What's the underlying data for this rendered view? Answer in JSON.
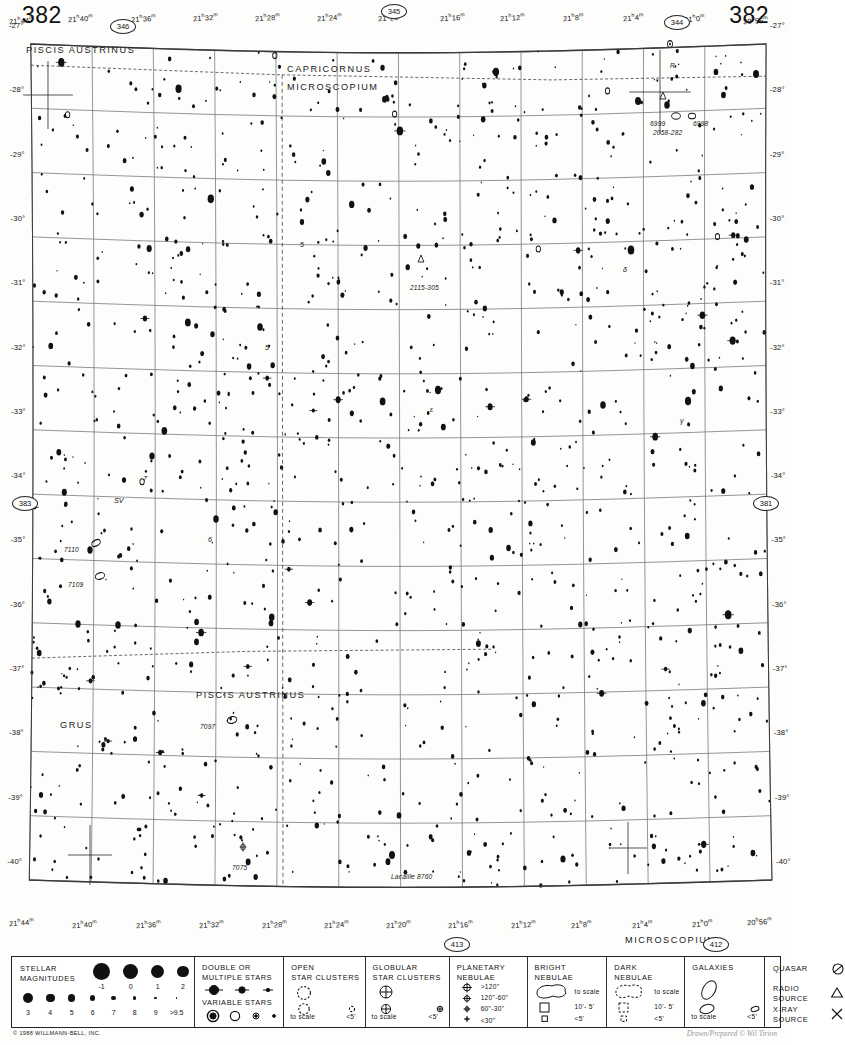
{
  "chart": {
    "number_left": "382",
    "number_right": "382",
    "copyright": "© 1988 WILLMANN-BELL, INC.",
    "signature": "Drawn/Prepared © Wil Tirion",
    "epoch_note": ""
  },
  "neighbors": [
    {
      "id": "346",
      "x": 110,
      "y": 19,
      "name": "neighbor-chart-346"
    },
    {
      "id": "345",
      "x": 381,
      "y": 4,
      "name": "neighbor-chart-345"
    },
    {
      "id": "344",
      "x": 664,
      "y": 15,
      "name": "neighbor-chart-344"
    },
    {
      "id": "383",
      "x": 12,
      "y": 496,
      "name": "neighbor-chart-383"
    },
    {
      "id": "381",
      "x": 753,
      "y": 496,
      "name": "neighbor-chart-381"
    },
    {
      "id": "413",
      "x": 444,
      "y": 937,
      "name": "neighbor-chart-413"
    },
    {
      "id": "412",
      "x": 703,
      "y": 937,
      "name": "neighbor-chart-412"
    }
  ],
  "ra_labels_top": [
    {
      "t": "21h44m",
      "x": 30,
      "y": 12
    },
    {
      "t": "21h40m",
      "x": 110,
      "y": 10
    },
    {
      "t": "21h36m",
      "x": 196,
      "y": 10
    },
    {
      "t": "21h32m",
      "x": 281,
      "y": 9
    },
    {
      "t": "21h28m",
      "x": 366,
      "y": 9
    },
    {
      "t": "21h24m",
      "x": 450,
      "y": 9
    },
    {
      "t": "21h20m",
      "x": 534,
      "y": 9
    },
    {
      "t": "21h16m",
      "x": 618,
      "y": 9
    },
    {
      "t": "21h12m",
      "x": 700,
      "y": 9
    },
    {
      "t": "21h8m",
      "x": 786,
      "y": 9
    },
    {
      "t": "21h4m",
      "x": 869,
      "y": 9
    },
    {
      "t": "21h0m",
      "x": 952,
      "y": 10
    },
    {
      "t": "20h56m",
      "x": 1032,
      "y": 12
    }
  ],
  "ra_labels_bottom": [
    {
      "t": "21h44m",
      "x": 30,
      "y": 900
    },
    {
      "t": "21h40m",
      "x": 116,
      "y": 902
    },
    {
      "t": "21h36m",
      "x": 204,
      "y": 902
    },
    {
      "t": "21h32m",
      "x": 290,
      "y": 902
    },
    {
      "t": "21h28m",
      "x": 375,
      "y": 902
    },
    {
      "t": "21h24m",
      "x": 460,
      "y": 902
    },
    {
      "t": "21h20m",
      "x": 545,
      "y": 902
    },
    {
      "t": "21h16m",
      "x": 630,
      "y": 902
    },
    {
      "t": "21h12m",
      "x": 715,
      "y": 902
    },
    {
      "t": "21h8m",
      "x": 798,
      "y": 902
    },
    {
      "t": "21h4m",
      "x": 880,
      "y": 902
    },
    {
      "t": "21h0m",
      "x": 962,
      "y": 901
    },
    {
      "t": "20h56m",
      "x": 1038,
      "y": 899
    }
  ],
  "dec_labels": [
    "-27°",
    "-28°",
    "-29°",
    "-30°",
    "-31°",
    "-32°",
    "-33°",
    "-34°",
    "-35°",
    "-36°",
    "-37°",
    "-38°",
    "-39°",
    "-40°"
  ],
  "constellations": [
    {
      "name": "PISCIS AUSTRINUS",
      "x": 26,
      "y": 28,
      "id": "piscis-austrinus-top"
    },
    {
      "name": "CAPRICORNUS",
      "x": 287,
      "y": 47,
      "id": "capricornus"
    },
    {
      "name": "MICROSCOPIUM",
      "x": 287,
      "y": 65,
      "id": "microscopium-top"
    },
    {
      "name": "PISCIS AUSTRINUS",
      "x": 196,
      "y": 673,
      "id": "piscis-austrinus-lower"
    },
    {
      "name": "GRUS",
      "x": 60,
      "y": 703,
      "id": "grus"
    },
    {
      "name": "MICROSCOPIUM",
      "x": 625,
      "y": 918,
      "id": "microscopium-bottom"
    }
  ],
  "deep_sky_labels": [
    {
      "t": "6999",
      "x": 650,
      "y": 103,
      "id": "ngc-6999"
    },
    {
      "t": "6998",
      "x": 693,
      "y": 103,
      "id": "ngc-6998"
    },
    {
      "t": "2058-282",
      "x": 653,
      "y": 112,
      "id": "radio-2058-282"
    },
    {
      "t": "2115-305",
      "x": 410,
      "y": 267,
      "id": "radio-2115-305"
    },
    {
      "t": "7110",
      "x": 64,
      "y": 529,
      "id": "ngc-7110"
    },
    {
      "t": "7109",
      "x": 68,
      "y": 564,
      "id": "ngc-7109"
    },
    {
      "t": "7097",
      "x": 200,
      "y": 706,
      "id": "ngc-7097"
    },
    {
      "t": "7075",
      "x": 232,
      "y": 847,
      "id": "ngc-7075"
    },
    {
      "t": "Lacaille 8760",
      "x": 391,
      "y": 856,
      "id": "lacaille-8760"
    },
    {
      "t": "R",
      "x": 670,
      "y": 45,
      "id": "variable-R"
    }
  ],
  "star_labels": [
    {
      "t": "5",
      "x": 300,
      "y": 223,
      "id": "star-5"
    },
    {
      "t": "5",
      "x": 265,
      "y": 326,
      "id": "star-5b"
    },
    {
      "t": "7",
      "x": 143,
      "y": 457,
      "id": "star-7"
    },
    {
      "t": "SV",
      "x": 114,
      "y": 479,
      "id": "star-SV"
    },
    {
      "t": "6",
      "x": 208,
      "y": 518,
      "id": "star-6"
    },
    {
      "t": "δ",
      "x": 623,
      "y": 248,
      "id": "star-delta"
    },
    {
      "t": "ε",
      "x": 430,
      "y": 388,
      "id": "star-epsilon"
    },
    {
      "t": "γ",
      "x": 680,
      "y": 399,
      "id": "star-gamma"
    }
  ],
  "legend": {
    "stellar_magnitudes": {
      "title_line1": "STELLAR",
      "title_line2": "MAGNITUDES",
      "row1": [
        {
          "mag": "-1",
          "r": 8.5
        },
        {
          "mag": "0",
          "r": 7.6
        },
        {
          "mag": "1",
          "r": 6.6
        },
        {
          "mag": "2",
          "r": 5.7
        }
      ],
      "row2": [
        {
          "mag": "3",
          "r": 5.0
        },
        {
          "mag": "4",
          "r": 4.3
        },
        {
          "mag": "5",
          "r": 3.6
        },
        {
          "mag": "6",
          "r": 2.9
        },
        {
          "mag": "7",
          "r": 2.3
        },
        {
          "mag": "8",
          "r": 1.8
        },
        {
          "mag": "9",
          "r": 1.3
        },
        {
          "mag": ">9.5",
          "r": 0.9
        }
      ]
    },
    "double_stars": {
      "title_line1": "DOUBLE  OR",
      "title_line2": "MULTIPLE  STARS"
    },
    "variable_stars": {
      "title": "VARIABLE  STARS"
    },
    "open_clusters": {
      "title_line1": "OPEN",
      "title_line2": "STAR CLUSTERS",
      "scale_label": "to scale",
      "small_label": "<5'"
    },
    "globular_clusters": {
      "title_line1": "GLOBULAR",
      "title_line2": "STAR CLUSTERS",
      "scale_label": "to scale",
      "small_label": "<5'"
    },
    "planetary_nebulae": {
      "title_line1": "PLANETARY",
      "title_line2": "NEBULAE",
      "sizes": [
        ">120\"",
        "120\"-60\"",
        "60\"-30\"",
        "<30\""
      ]
    },
    "bright_nebulae": {
      "title_line1": "BRIGHT",
      "title_line2": "NEBULAE",
      "scale_label": "to scale",
      "mid_label": "10'- 5'",
      "small_label": "<5'"
    },
    "dark_nebulae": {
      "title_line1": "DARK",
      "title_line2": "NEBULAE",
      "scale_label": "to scale",
      "mid_label": "10'- 5'",
      "small_label": "<5'"
    },
    "galaxies": {
      "title": "GALAXIES",
      "scale_label": "to scale",
      "small_label": "<5'"
    },
    "other": [
      {
        "label_line1": "QUASAR",
        "label_line2": "",
        "icon": "quasar-icon"
      },
      {
        "label_line1": "RADIO",
        "label_line2": "SOURCE",
        "icon": "radio-source-icon"
      },
      {
        "label_line1": "X-RAY",
        "label_line2": "SOURCE",
        "icon": "xray-source-icon"
      }
    ]
  }
}
